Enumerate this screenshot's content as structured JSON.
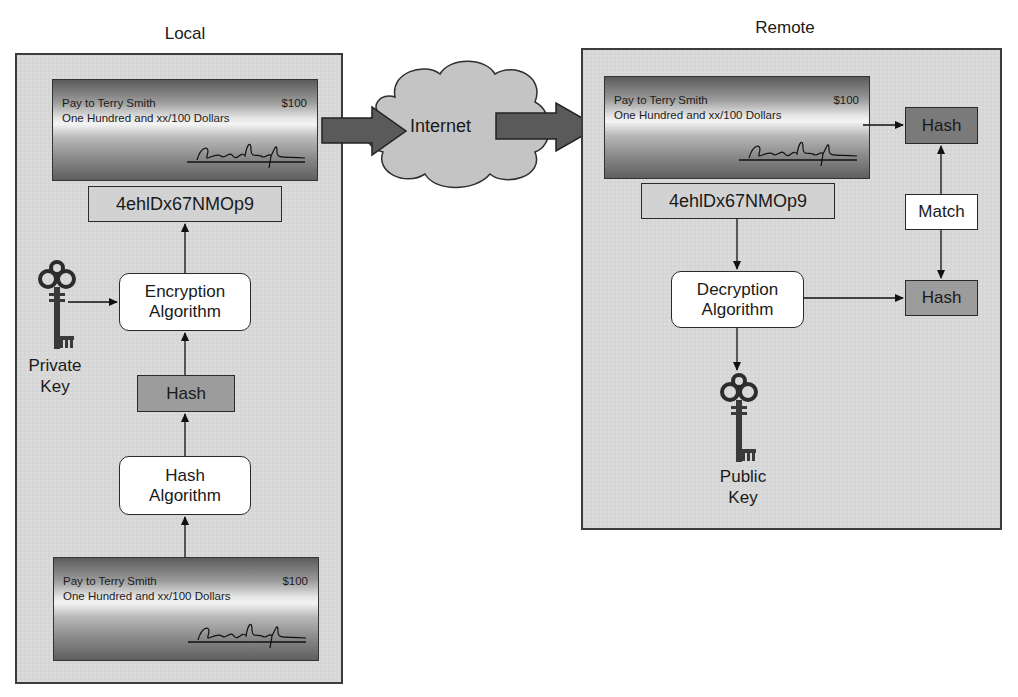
{
  "diagram": {
    "title_fragment": "",
    "local": {
      "title": "Local",
      "top_check": {
        "line1": "Pay to Terry Smith",
        "line2": "One Hundred and xx/100 Dollars",
        "amount": "$100"
      },
      "signature_value": "4ehlDx67NMOp9",
      "encryption_algorithm": "Encryption Algorithm",
      "encryption_line1": "Encryption",
      "encryption_line2": "Algorithm",
      "key_label_line1": "Private",
      "key_label_line2": "Key",
      "hash": "Hash",
      "hash_algorithm_line1": "Hash",
      "hash_algorithm_line2": "Algorithm",
      "bottom_check": {
        "line1": "Pay to Terry Smith",
        "line2": "One Hundred and xx/100 Dollars",
        "amount": "$100"
      }
    },
    "internet": {
      "label": "Internet"
    },
    "remote": {
      "title": "Remote",
      "check": {
        "line1": "Pay to Terry Smith",
        "line2": "One Hundred and xx/100 Dollars",
        "amount": "$100"
      },
      "signature_value": "4ehlDx67NMOp9",
      "decryption_line1": "Decryption",
      "decryption_line2": "Algorithm",
      "key_label_line1": "Public",
      "key_label_line2": "Key",
      "hash_top": "Hash",
      "match": "Match",
      "hash_bottom": "Hash"
    },
    "colors": {
      "panel_bg": "#d6d6d6",
      "panel_border": "#3c3c3c",
      "hash_dark": "#7a7a7a",
      "hash_mid": "#9c9c9c",
      "arrow_fill": "#5a5a5a",
      "cloud_fill": "#c4c4c4"
    }
  }
}
